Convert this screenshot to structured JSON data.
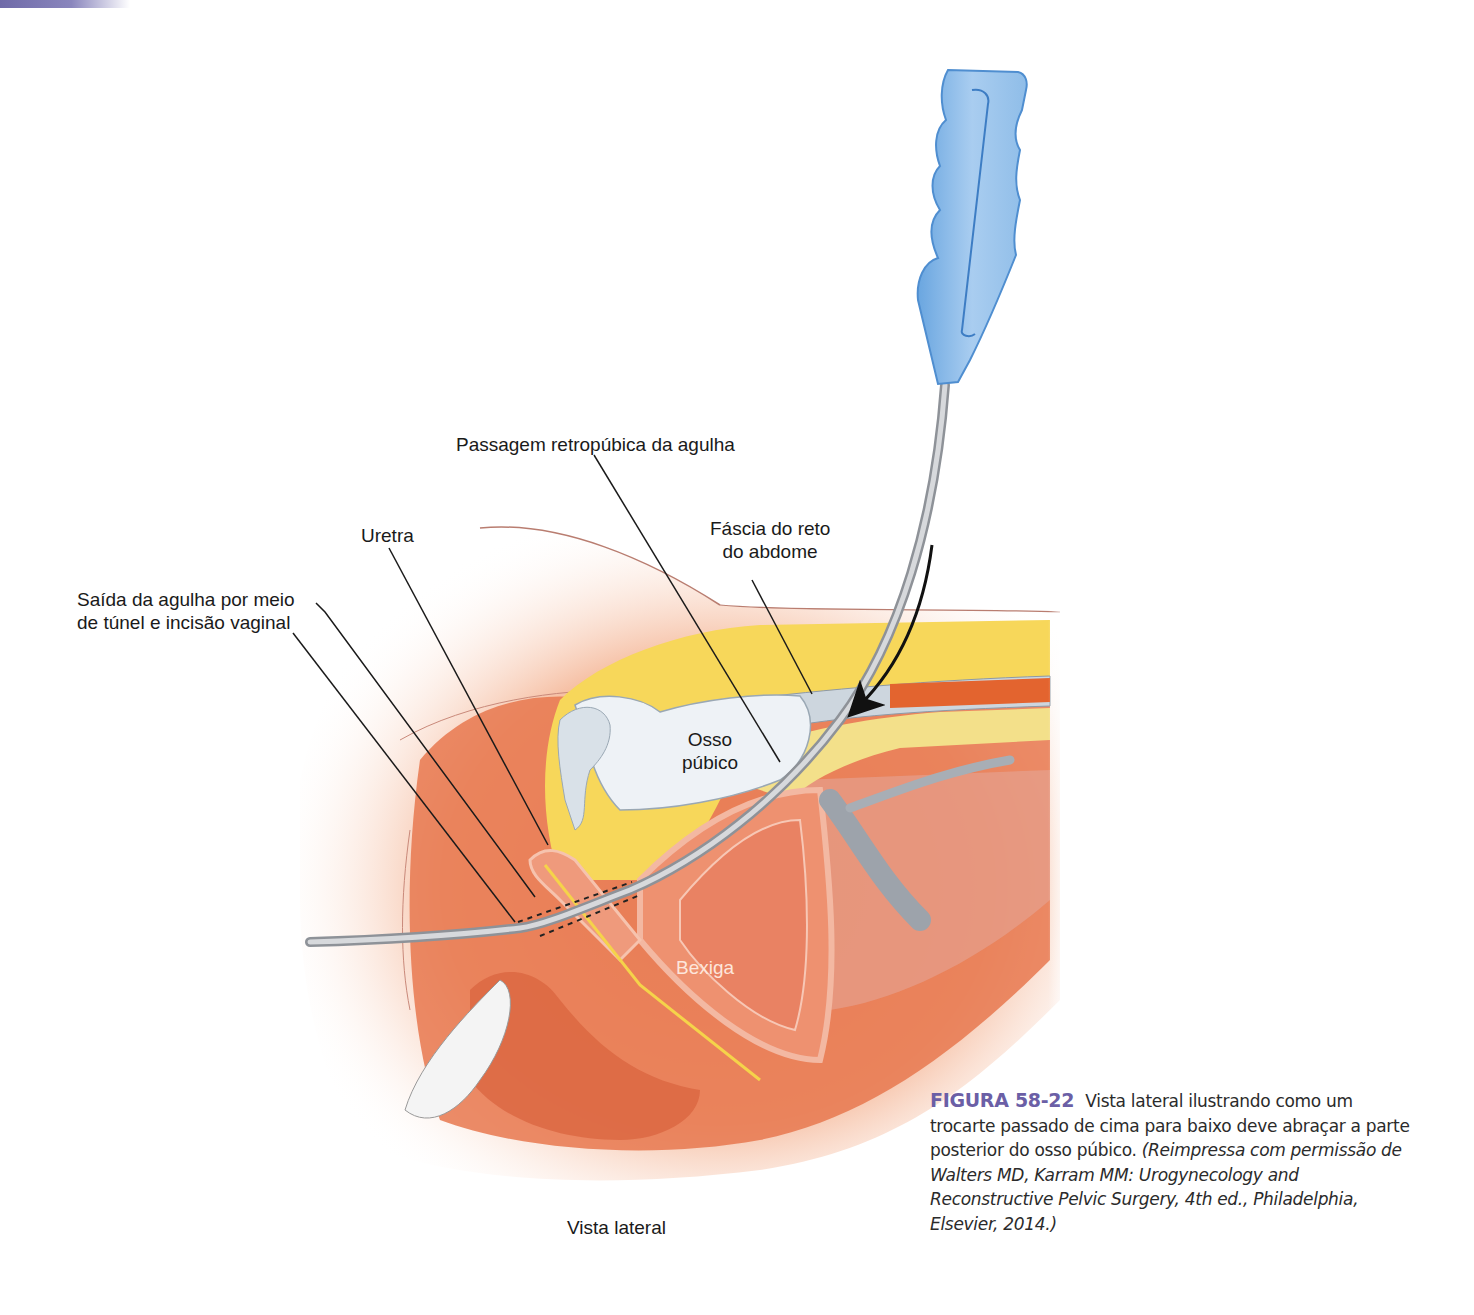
{
  "header": {
    "accent_bar_color": "#6f6aa8"
  },
  "figure": {
    "labels": {
      "passagem": "Passagem retropúbica da agulha",
      "uretra": "Uretra",
      "fascia_line1": "Fáscia do reto",
      "fascia_line2": "do abdome",
      "saida_line1": "Saída da agulha por meio",
      "saida_line2": "de túnel e incisão vaginal",
      "osso_line1": "Osso",
      "osso_line2": "púbico",
      "bexiga": "Bexiga",
      "view": "Vista lateral"
    },
    "illustration_elements": [
      "trocar-handle",
      "trocar-needle",
      "direction-arrow",
      "pubic-bone",
      "rectus-fascia",
      "bladder",
      "urethra",
      "vagina",
      "rectum"
    ],
    "colors": {
      "handle_blue": "#8fbde8",
      "needle_gray": "#b9bcc2",
      "fat_yellow": "#f7d75a",
      "tissue_orange": "#e8784f",
      "skin_peach": "#f6c1a6",
      "bone_white": "#eef2f6"
    }
  },
  "caption": {
    "figure_number": "FIGURA 58-22",
    "text": "Vista lateral ilustrando como um trocarte passado de cima para baixo deve abraçar a parte posterior do osso púbico.",
    "reference": "(Reimpressa com permissão de Walters MD, Karram MM: Urogynecology and Reconstructive Pelvic Surgery, 4th ed., Philadelphia, Elsevier, 2014.)",
    "accent_color": "#6b5fa6"
  }
}
